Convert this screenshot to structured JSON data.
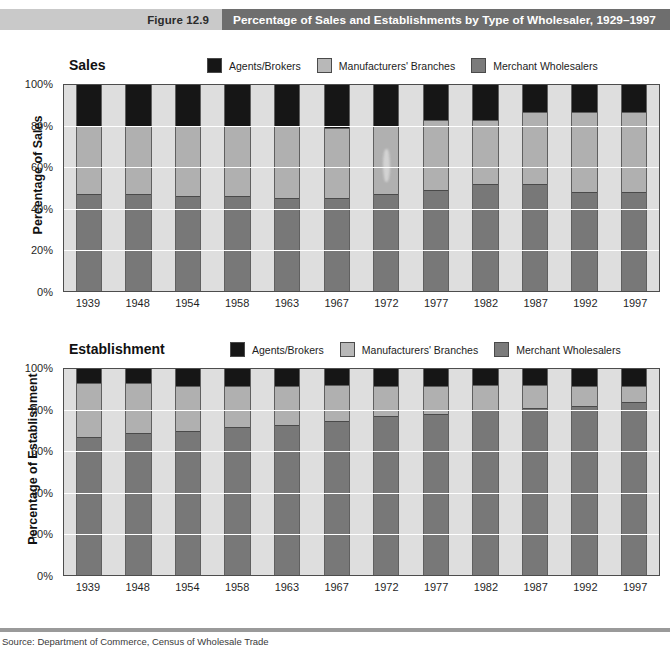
{
  "figure": {
    "label": "Figure 12.9",
    "title": "Percentage of Sales and Establishments by Type of Wholesaler, 1929–1997"
  },
  "legend": {
    "agents": "Agents/Brokers",
    "branches": "Manufacturers' Branches",
    "merchant": "Merchant Wholesalers"
  },
  "panels": {
    "sales": {
      "title": "Sales",
      "yaxis_title": "Percentage of Sales"
    },
    "establishment": {
      "title": "Establishment",
      "yaxis_title": "Percentage of Establishment"
    }
  },
  "ytick_labels": [
    "100%",
    "80%",
    "60%",
    "40%",
    "20%",
    "0%"
  ],
  "footer": {
    "source": "Source: Department of Commerce, Census of Wholesale Trade"
  },
  "colors": {
    "agents": "#161616",
    "branches": "#b0b0b0",
    "merchant": "#787878",
    "plot_background": "#dedede",
    "header_band_left": "#c9c9c9",
    "header_band_right": "#6e6e6e"
  },
  "chart_data": [
    {
      "type": "bar",
      "stacked": true,
      "title": "Sales",
      "xlabel": "",
      "ylabel": "Percentage of Sales",
      "ylim": [
        0,
        100
      ],
      "yticks": [
        0,
        20,
        40,
        60,
        80,
        100
      ],
      "grid": true,
      "legend_position": "top-right",
      "categories": [
        "1939",
        "1948",
        "1954",
        "1958",
        "1963",
        "1967",
        "1972",
        "1977",
        "1982",
        "1987",
        "1992",
        "1997"
      ],
      "series": [
        {
          "name": "Merchant Wholesalers",
          "values": [
            47,
            47,
            46,
            46,
            45,
            45,
            47,
            49,
            52,
            52,
            48,
            48
          ]
        },
        {
          "name": "Manufacturers' Branches",
          "values": [
            33,
            33,
            34,
            34,
            35,
            34,
            33,
            34,
            31,
            35,
            39,
            39
          ]
        },
        {
          "name": "Agents/Brokers",
          "values": [
            20,
            20,
            20,
            20,
            20,
            21,
            20,
            17,
            17,
            13,
            13,
            13
          ]
        }
      ],
      "annotations": [
        "light smudge artifact over the 1972 Manufacturers' Branches segment"
      ]
    },
    {
      "type": "bar",
      "stacked": true,
      "title": "Establishment",
      "xlabel": "",
      "ylabel": "Percentage of Establishment",
      "ylim": [
        0,
        100
      ],
      "yticks": [
        0,
        20,
        40,
        60,
        80,
        100
      ],
      "grid": true,
      "legend_position": "top-right",
      "categories": [
        "1939",
        "1948",
        "1954",
        "1958",
        "1963",
        "1967",
        "1972",
        "1977",
        "1982",
        "1987",
        "1992",
        "1997"
      ],
      "series": [
        {
          "name": "Merchant Wholesalers",
          "values": [
            67,
            69,
            70,
            72,
            73,
            75,
            77,
            78,
            80,
            81,
            82,
            84
          ]
        },
        {
          "name": "Manufacturers' Branches",
          "values": [
            26,
            24,
            22,
            20,
            19,
            17,
            15,
            14,
            12,
            11,
            10,
            8
          ]
        },
        {
          "name": "Agents/Brokers",
          "values": [
            7,
            7,
            8,
            8,
            8,
            8,
            8,
            8,
            8,
            8,
            8,
            8
          ]
        }
      ]
    }
  ]
}
